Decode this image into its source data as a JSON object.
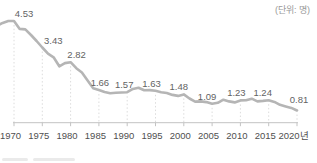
{
  "chart_data": {
    "type": "line",
    "title": "",
    "unit_label": "(단위: 명)",
    "xlabel": "",
    "ylabel": "",
    "categories": [
      "1970",
      "1975",
      "1980",
      "1985",
      "1990",
      "1995",
      "2000",
      "2005",
      "2010",
      "2015",
      "2020년"
    ],
    "values": [
      4.53,
      3.43,
      2.82,
      1.66,
      1.57,
      1.63,
      1.48,
      1.09,
      1.23,
      1.24,
      0.81
    ],
    "value_labels": [
      "4.53",
      "3.43",
      "2.82",
      "1.66",
      "1.57",
      "1.63",
      "1.48",
      "1.09",
      "1.23",
      "1.24",
      "0.81"
    ],
    "ylim": [
      0.3,
      4.6
    ],
    "grid": "vertical-dotted",
    "legend": "none",
    "annual_series": {
      "start_year": 1967,
      "values": [
        4.33,
        4.45,
        4.53,
        4.53,
        4.2,
        4.18,
        3.95,
        3.7,
        3.43,
        3.17,
        3.02,
        2.65,
        2.78,
        2.82,
        2.57,
        2.39,
        2.06,
        1.74,
        1.66,
        1.58,
        1.53,
        1.55,
        1.56,
        1.57,
        1.71,
        1.76,
        1.65,
        1.66,
        1.63,
        1.57,
        1.54,
        1.46,
        1.42,
        1.48,
        1.31,
        1.18,
        1.19,
        1.16,
        1.09,
        1.13,
        1.26,
        1.19,
        1.15,
        1.23,
        1.24,
        1.3,
        1.19,
        1.21,
        1.24,
        1.17,
        1.05,
        0.98,
        0.92,
        0.81
      ]
    }
  },
  "colors": {
    "line": "#b5b5b5",
    "value_label": "#636363",
    "tick_label": "#4f4f4f",
    "unit_label": "#999999",
    "axis": "#c3c3c3",
    "gridline": "#dcdcdc",
    "background": "#ffffff"
  }
}
